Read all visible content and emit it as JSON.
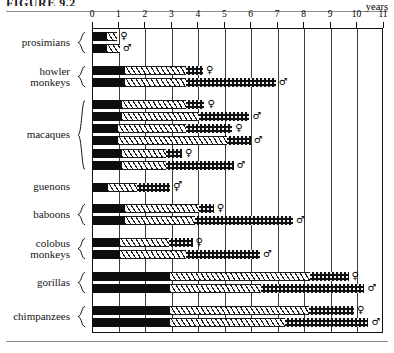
{
  "figure": {
    "title_partial": "FIGURE 9.2",
    "years_label": "years",
    "axis": {
      "min": 0,
      "max": 11,
      "ticks": [
        0,
        1,
        2,
        3,
        4,
        5,
        6,
        7,
        8,
        9,
        10,
        11
      ],
      "tick_labels": [
        "0",
        "1",
        "2",
        "3",
        "4",
        "5",
        "6",
        "7",
        "8",
        "9",
        "10",
        "11"
      ],
      "unit": "years"
    },
    "symbols": {
      "female": "♀",
      "male": "♂",
      "both": "⚥"
    }
  },
  "chart_data": {
    "type": "bar",
    "orientation": "horizontal",
    "title": "FIGURE 9.2",
    "xlabel": "years",
    "ylabel": "",
    "xlim": [
      0,
      11
    ],
    "grid": true,
    "legend_position": "none",
    "stacked": true,
    "stack_segments": [
      "infant",
      "juvenile",
      "adolescent"
    ],
    "groups": [
      {
        "label": "prosimians",
        "label_lines": [
          "prosimians"
        ],
        "bars": [
          {
            "sex": "female",
            "sex_symbol": "♀",
            "infant": 0.55,
            "juvenile": 0.95,
            "adolescent": 0.95,
            "total": 0.95
          },
          {
            "sex": "male",
            "sex_symbol": "♂",
            "infant": 0.55,
            "juvenile": 1.05,
            "adolescent": 1.05,
            "total": 1.05
          }
        ]
      },
      {
        "label": "howler monkeys",
        "label_lines": [
          "howler",
          "monkeys"
        ],
        "bars": [
          {
            "sex": "female",
            "sex_symbol": "♀",
            "infant": 1.25,
            "juvenile": 3.55,
            "adolescent": 4.2,
            "total": 4.2
          },
          {
            "sex": "male",
            "sex_symbol": "♂",
            "infant": 1.25,
            "juvenile": 3.55,
            "adolescent": 6.95,
            "total": 6.95
          }
        ]
      },
      {
        "label": "macaques",
        "label_lines": [
          "macaques"
        ],
        "bars": [
          {
            "sex": "female",
            "sex_symbol": "♀",
            "infant": 1.15,
            "juvenile": 3.55,
            "adolescent": 4.25,
            "total": 4.25
          },
          {
            "sex": "male",
            "sex_symbol": "♂",
            "infant": 1.15,
            "juvenile": 4.05,
            "adolescent": 5.95,
            "total": 5.95
          },
          {
            "sex": "female",
            "sex_symbol": "♀",
            "infant": 1.0,
            "juvenile": 3.55,
            "adolescent": 5.3,
            "total": 5.3
          },
          {
            "sex": "male",
            "sex_symbol": "♂",
            "infant": 1.0,
            "juvenile": 5.1,
            "adolescent": 6.0,
            "total": 6.0
          },
          {
            "sex": "female",
            "sex_symbol": "♀",
            "infant": 1.15,
            "juvenile": 2.8,
            "adolescent": 3.4,
            "total": 3.4
          },
          {
            "sex": "male",
            "sex_symbol": "♂",
            "infant": 1.15,
            "juvenile": 2.8,
            "adolescent": 5.35,
            "total": 5.35
          }
        ]
      },
      {
        "label": "guenons",
        "label_lines": [
          "guenons"
        ],
        "bars": [
          {
            "sex": "both",
            "sex_symbol": "⚥",
            "infant": 0.6,
            "juvenile": 1.7,
            "adolescent": 2.95,
            "total": 2.95
          }
        ]
      },
      {
        "label": "baboons",
        "label_lines": [
          "baboons"
        ],
        "bars": [
          {
            "sex": "female",
            "sex_symbol": "♀",
            "infant": 1.25,
            "juvenile": 4.05,
            "adolescent": 4.6,
            "total": 4.6
          },
          {
            "sex": "male",
            "sex_symbol": "♂",
            "infant": 1.25,
            "juvenile": 3.9,
            "adolescent": 7.6,
            "total": 7.6
          }
        ]
      },
      {
        "label": "colobus monkeys",
        "label_lines": [
          "colobus",
          "monkeys"
        ],
        "bars": [
          {
            "sex": "female",
            "sex_symbol": "♀",
            "infant": 1.05,
            "juvenile": 2.9,
            "adolescent": 3.8,
            "total": 3.8
          },
          {
            "sex": "male",
            "sex_symbol": "♂",
            "infant": 1.05,
            "juvenile": 3.55,
            "adolescent": 6.35,
            "total": 6.35
          }
        ]
      },
      {
        "label": "gorillas",
        "label_lines": [
          "gorillas"
        ],
        "bars": [
          {
            "sex": "female",
            "sex_symbol": "♀",
            "infant": 2.95,
            "juvenile": 8.25,
            "adolescent": 9.7,
            "total": 9.7
          },
          {
            "sex": "male",
            "sex_symbol": "♂",
            "infant": 2.95,
            "juvenile": 6.4,
            "adolescent": 10.3,
            "total": 10.3
          }
        ]
      },
      {
        "label": "chimpanzees",
        "label_lines": [
          "chimpanzees"
        ],
        "bars": [
          {
            "sex": "female",
            "sex_symbol": "♀",
            "infant": 2.95,
            "juvenile": 8.2,
            "adolescent": 9.9,
            "total": 9.9
          },
          {
            "sex": "male",
            "sex_symbol": "♂",
            "infant": 2.95,
            "juvenile": 7.3,
            "adolescent": 10.45,
            "total": 10.45
          }
        ]
      }
    ]
  },
  "colors": {
    "infant": "#0d0d0d",
    "juvenile": "#ffffff",
    "adolescent": "#111111",
    "grid": "#3a3a3a",
    "rule": "#8d8d8d"
  }
}
